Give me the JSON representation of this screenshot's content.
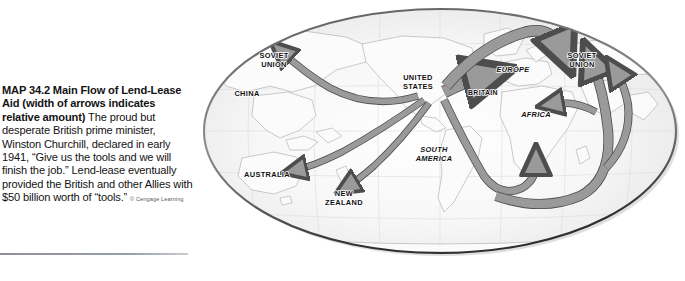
{
  "caption": {
    "heading": "MAP 34.2  Main Flow of Lend-Lease Aid (width of arrows indicates relative amount)",
    "body": "The proud but desperate British prime minister, Winston Churchill, declared in early 1941, “Give us the tools and we will finish the job.” Lend-lease eventually provided the British and other Allies with $50 billion worth of “tools.”",
    "credit": "© Cengage Learning"
  },
  "map": {
    "projection": "elliptical-world",
    "hub": "UNITED STATES",
    "labels": [
      {
        "id": "soviet-union-west",
        "text_line1": "SOVIET",
        "text_line2": "UNION",
        "style": "upright",
        "x": 78,
        "y": 58
      },
      {
        "id": "china",
        "text_line1": "CHINA",
        "text_line2": "",
        "style": "upright",
        "x": 51,
        "y": 96
      },
      {
        "id": "united-states",
        "text_line1": "UNITED",
        "text_line2": "STATES",
        "style": "upright",
        "x": 222,
        "y": 80
      },
      {
        "id": "britain",
        "text_line1": "BRITAIN",
        "text_line2": "",
        "style": "upright",
        "x": 287,
        "y": 95
      },
      {
        "id": "europe",
        "text_line1": "EUROPE",
        "text_line2": "",
        "style": "italic",
        "x": 317,
        "y": 72
      },
      {
        "id": "soviet-union-east",
        "text_line1": "SOVIET",
        "text_line2": "UNION",
        "style": "upright",
        "x": 386,
        "y": 58
      },
      {
        "id": "africa",
        "text_line1": "AFRICA",
        "text_line2": "",
        "style": "italic",
        "x": 340,
        "y": 117
      },
      {
        "id": "south-america",
        "text_line1": "SOUTH",
        "text_line2": "AMERICA",
        "style": "italic",
        "x": 238,
        "y": 152
      },
      {
        "id": "australia",
        "text_line1": "AUSTRALIA",
        "text_line2": "",
        "style": "upright",
        "x": 71,
        "y": 177
      },
      {
        "id": "new-zealand",
        "text_line1": "NEW",
        "text_line2": "ZEALAND",
        "style": "upright",
        "x": 148,
        "y": 196
      }
    ],
    "flows": [
      {
        "id": "flow-us-to-soviet-pacific",
        "from": "UNITED STATES",
        "to": "SOVIET UNION",
        "route": "north-pacific",
        "width": "medium"
      },
      {
        "id": "flow-us-to-australia",
        "from": "UNITED STATES",
        "to": "AUSTRALIA",
        "route": "south-pacific",
        "width": "medium"
      },
      {
        "id": "flow-us-to-new-zealand",
        "from": "UNITED STATES",
        "to": "NEW ZEALAND",
        "route": "south-pacific",
        "width": "medium"
      },
      {
        "id": "flow-us-to-britain",
        "from": "UNITED STATES",
        "to": "BRITAIN",
        "route": "north-atlantic",
        "width": "wide"
      },
      {
        "id": "flow-us-to-soviet-arctic",
        "from": "UNITED STATES",
        "to": "SOVIET UNION",
        "route": "arctic-murmansk",
        "width": "wide"
      },
      {
        "id": "flow-us-to-africa",
        "from": "UNITED STATES",
        "to": "AFRICA",
        "route": "south-atlantic-cape",
        "width": "medium"
      },
      {
        "id": "flow-cape-to-persian-gulf",
        "from": "UNITED STATES",
        "to": "SOVIET UNION",
        "route": "cape-to-persian-gulf",
        "width": "wide"
      }
    ],
    "colors": {
      "arrow_fill": "#9a9a9a",
      "arrow_stroke": "#4d4d4d",
      "ocean": "#f3f3f3",
      "land_stroke": "#b4b4b4",
      "graticule": "#d7d7d7",
      "globe_edge": "#3f3f3f"
    }
  }
}
